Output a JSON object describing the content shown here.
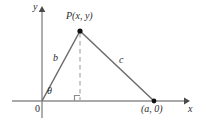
{
  "figure": {
    "colors": {
      "axis": "#8c8c8c",
      "triangle": "#6b6b6b",
      "dashed": "#b0b0b0",
      "point": "#1a1a1a",
      "label": "#2b2b2b",
      "background": "#ffffff"
    },
    "axes": {
      "x_label": "x",
      "y_label": "y",
      "origin_label": "0"
    },
    "labels": {
      "vertex_p": "P(x, y)",
      "vertex_a": "(a, 0)",
      "side_b": "b",
      "side_c": "c",
      "angle_theta": "θ"
    },
    "geometry": {
      "origin": [
        42,
        101
      ],
      "apex": [
        80,
        31
      ],
      "base_point": [
        154,
        101
      ],
      "foot": [
        80,
        101
      ],
      "x_axis_from": [
        12,
        101
      ],
      "x_axis_to": [
        188,
        101
      ],
      "y_axis_from": [
        42,
        118
      ],
      "y_axis_to": [
        42,
        8
      ]
    }
  }
}
